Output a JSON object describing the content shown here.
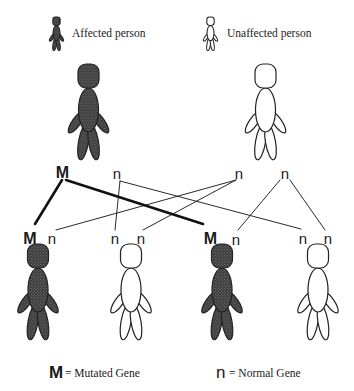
{
  "legend": {
    "affected_label": "Affected person",
    "unaffected_label": "Unaffected person",
    "affected_icon": "affected-person-icon",
    "unaffected_icon": "unaffected-person-icon"
  },
  "parents": [
    {
      "status": "affected",
      "genes": [
        "M",
        "n"
      ]
    },
    {
      "status": "unaffected",
      "genes": [
        "n",
        "n"
      ]
    }
  ],
  "children": [
    {
      "status": "affected",
      "genes": [
        "M",
        "n"
      ]
    },
    {
      "status": "unaffected",
      "genes": [
        "n",
        "n"
      ]
    },
    {
      "status": "affected",
      "genes": [
        "M",
        "n"
      ]
    },
    {
      "status": "unaffected",
      "genes": [
        "n",
        "n"
      ]
    }
  ],
  "inheritance_lines": [
    {
      "from": "parent1.M",
      "to": "child1.M",
      "weight": "thick"
    },
    {
      "from": "parent1.M",
      "to": "child3.M",
      "weight": "thick"
    },
    {
      "from": "parent1.n",
      "to": "child2.n1",
      "weight": "thin"
    },
    {
      "from": "parent1.n",
      "to": "child4.n1",
      "weight": "thin"
    },
    {
      "from": "parent2.n1",
      "to": "child1.n",
      "weight": "thin"
    },
    {
      "from": "parent2.n1",
      "to": "child2.n2",
      "weight": "thin"
    },
    {
      "from": "parent2.n2",
      "to": "child3.n",
      "weight": "thin"
    },
    {
      "from": "parent2.n2",
      "to": "child4.n2",
      "weight": "thin"
    }
  ],
  "key": {
    "mutated_symbol": "M",
    "mutated_label": "= Mutated Gene",
    "normal_symbol": "n",
    "normal_label": "= Normal Gene"
  },
  "colors": {
    "affected_fill": "#4a4a4a",
    "outline": "#222222",
    "unaffected_fill": "#ffffff",
    "background": "#ffffff"
  }
}
